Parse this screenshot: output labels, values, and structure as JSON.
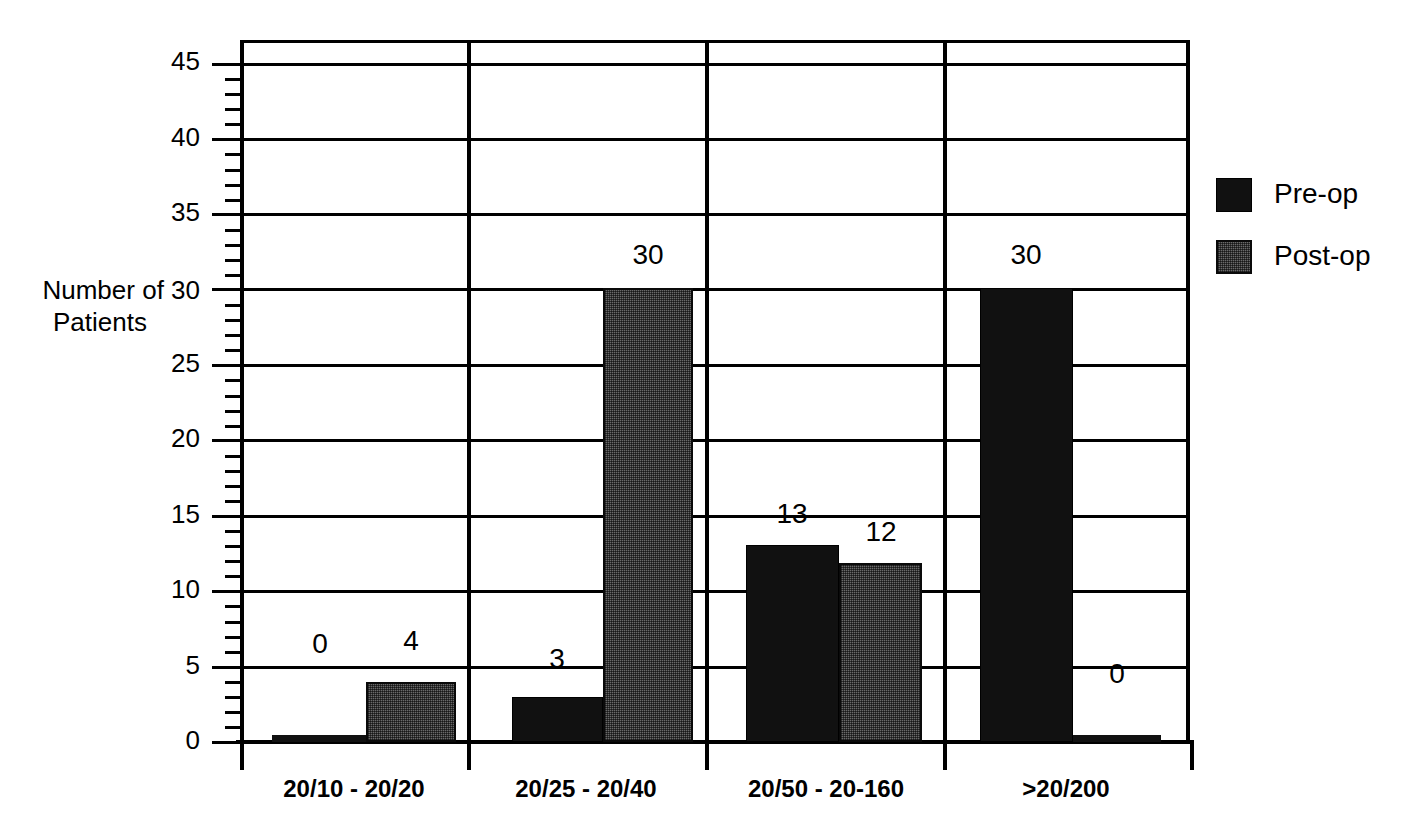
{
  "chart_data": {
    "type": "bar",
    "title": "",
    "xlabel": "",
    "ylabel": "Number of Patients",
    "ylabel_line1": "Number of 30",
    "ylabel_line2": "Patients",
    "ylim": [
      0,
      45
    ],
    "ytick_step": 5,
    "yminor_step": 1,
    "grid": true,
    "legend_position": "right",
    "categories": [
      "20/10 - 20/20",
      "20/25 - 20/40",
      "20/50 - 20-160",
      ">20/200"
    ],
    "series": [
      {
        "name": "Pre-op",
        "color": "#111111",
        "values": [
          0,
          3,
          13,
          30
        ]
      },
      {
        "name": "Post-op",
        "color": "#6a6a6a",
        "values": [
          4,
          30,
          12,
          0
        ]
      }
    ],
    "yticks": [
      "0",
      "5",
      "10",
      "15",
      "20",
      "25",
      "30",
      "35",
      "40",
      "45"
    ],
    "data_labels": [
      {
        "text": "0",
        "series": "Pre-op",
        "category": "20/10 - 20/20"
      },
      {
        "text": "4",
        "series": "Post-op",
        "category": "20/10 - 20/20"
      },
      {
        "text": "3",
        "series": "Pre-op",
        "category": "20/25 - 20/40"
      },
      {
        "text": "30",
        "series": "Post-op",
        "category": "20/25 - 20/40"
      },
      {
        "text": "13",
        "series": "Pre-op",
        "category": "20/50 - 20-160"
      },
      {
        "text": "12",
        "series": "Post-op",
        "category": "20/50 - 20-160"
      },
      {
        "text": "30",
        "series": "Pre-op",
        "category": ">20/200"
      },
      {
        "text": "0",
        "series": "Post-op",
        "category": ">20/200"
      }
    ]
  },
  "yaxis": {
    "t0": "0",
    "t5": "5",
    "t10": "10",
    "t15": "15",
    "t20": "20",
    "t25": "25",
    "t30": "30",
    "t35": "35",
    "t40": "40",
    "t45": "45",
    "title_line1": "Number of 30",
    "title_line2": "Patients"
  },
  "xaxis": {
    "c0": "20/10 - 20/20",
    "c1": "20/25 - 20/40",
    "c2": "20/50 - 20-160",
    "c3": ">20/200"
  },
  "values": {
    "g0_pre": "0",
    "g0_post": "4",
    "g1_pre": "3",
    "g1_post": "30",
    "g2_pre": "13",
    "g2_post": "12",
    "g3_pre": "30",
    "g3_post": "0"
  },
  "legend": {
    "preop": "Pre-op",
    "postop": "Post-op"
  }
}
